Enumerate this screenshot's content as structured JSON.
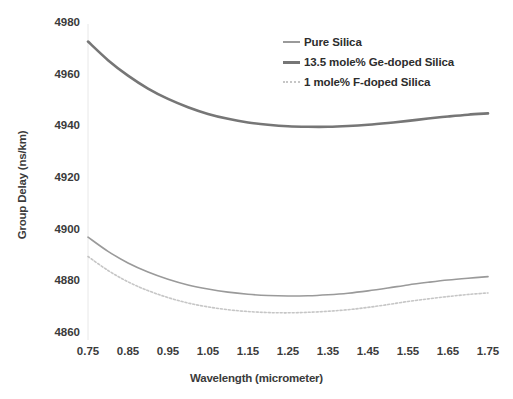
{
  "chart_data": {
    "type": "line",
    "title": "",
    "xlabel": "Wavelength (micrometer)",
    "ylabel": "Group Delay (ns/km)",
    "xlim": [
      0.75,
      1.75
    ],
    "ylim": [
      4860,
      4980
    ],
    "xticks": [
      "0.75",
      "0.85",
      "0.95",
      "1.05",
      "1.15",
      "1.25",
      "1.35",
      "1.45",
      "1.55",
      "1.65",
      "1.75"
    ],
    "yticks": [
      "4860",
      "4880",
      "4900",
      "4920",
      "4940",
      "4960",
      "4980"
    ],
    "grid": false,
    "legend_position": "top-right",
    "x": [
      0.75,
      0.8,
      0.85,
      0.9,
      0.95,
      1.0,
      1.05,
      1.1,
      1.15,
      1.2,
      1.25,
      1.3,
      1.35,
      1.4,
      1.45,
      1.5,
      1.55,
      1.6,
      1.65,
      1.7,
      1.75
    ],
    "series": [
      {
        "name": "Pure Silica",
        "color": "#9a9a9a",
        "width": 1.6,
        "dash": "none",
        "values": [
          4897.5,
          4892.0,
          4887.5,
          4884.0,
          4881.2,
          4879.0,
          4877.4,
          4876.2,
          4875.4,
          4874.9,
          4874.7,
          4874.8,
          4875.2,
          4875.8,
          4876.7,
          4877.8,
          4879.0,
          4880.0,
          4880.9,
          4881.6,
          4882.2
        ]
      },
      {
        "name": "13.5 mole% Ge-doped Silica",
        "color": "#767676",
        "width": 2.6,
        "dash": "none",
        "values": [
          4973.2,
          4966.0,
          4960.0,
          4955.0,
          4951.0,
          4947.8,
          4945.2,
          4943.3,
          4941.9,
          4941.0,
          4940.4,
          4940.2,
          4940.2,
          4940.5,
          4941.0,
          4941.7,
          4942.5,
          4943.4,
          4944.2,
          4944.9,
          4945.4
        ]
      },
      {
        "name": "1 mole% F-doped Silica",
        "color": "#c6c6c6",
        "width": 1.6,
        "dash": "2,2",
        "values": [
          4890.0,
          4884.6,
          4880.2,
          4876.8,
          4874.1,
          4872.0,
          4870.5,
          4869.4,
          4868.7,
          4868.3,
          4868.2,
          4868.4,
          4868.8,
          4869.4,
          4870.3,
          4871.4,
          4872.6,
          4873.6,
          4874.5,
          4875.3,
          4875.9
        ]
      }
    ]
  },
  "legend": {
    "items": [
      {
        "label": "Pure Silica"
      },
      {
        "label": "13.5 mole% Ge-doped Silica"
      },
      {
        "label": "1 mole% F-doped Silica"
      }
    ]
  },
  "axes": {
    "y_title": "Group Delay (ns/km)",
    "x_title": "Wavelength (micrometer)"
  }
}
